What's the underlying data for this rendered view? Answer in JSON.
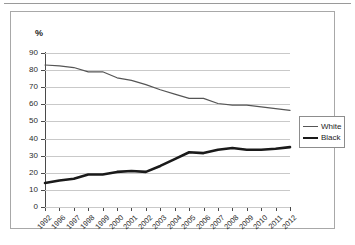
{
  "chart_data": {
    "type": "line",
    "title": "",
    "xlabel": "",
    "ylabel": "%",
    "ylim": [
      0,
      90
    ],
    "ytick_step": 10,
    "yticks": [
      "0",
      "10",
      "20",
      "30",
      "40",
      "50",
      "60",
      "70",
      "80",
      "90"
    ],
    "grid": true,
    "legend_position": "right",
    "categories": [
      "1992",
      "1996",
      "1997",
      "1998",
      "1999",
      "2000",
      "2001",
      "2002",
      "2003",
      "2004",
      "2005",
      "2006",
      "2007",
      "2008",
      "2009",
      "2010",
      "2011",
      "2012"
    ],
    "series": [
      {
        "name": "White",
        "color": "#555555",
        "line_width": 1.2,
        "values": [
          83.0,
          82.5,
          81.5,
          79.0,
          79.0,
          75.5,
          74.0,
          71.5,
          68.5,
          66.0,
          63.5,
          63.5,
          60.5,
          59.5,
          59.5,
          58.5,
          57.5,
          56.5
        ]
      },
      {
        "name": "Black",
        "color": "#1a1a1a",
        "line_width": 2.6,
        "values": [
          14.0,
          15.5,
          16.5,
          19.0,
          19.0,
          20.5,
          21.0,
          20.5,
          24.0,
          28.0,
          32.0,
          31.5,
          33.5,
          34.5,
          33.5,
          33.5,
          34.0,
          35.0
        ]
      }
    ]
  },
  "axis": {
    "percent_symbol": "%"
  },
  "legend": {
    "entries": [
      {
        "label": "White",
        "swatch": "thin-line-swatch"
      },
      {
        "label": "Black",
        "swatch": "thick-line-swatch"
      }
    ]
  }
}
